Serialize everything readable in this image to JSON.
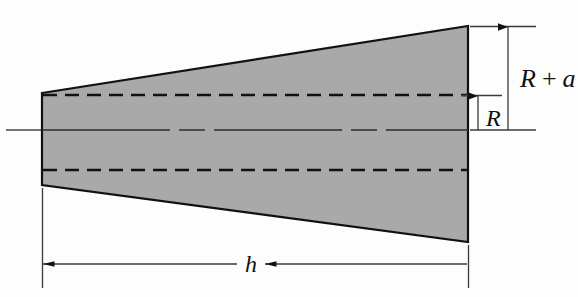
{
  "figure": {
    "type": "engineering-cross-section-diagram",
    "background_color": "#fdfdfd",
    "shape": {
      "name": "frustum-cross-section",
      "fill_color": "#a9a9a9",
      "stroke_color": "#111111",
      "stroke_width": 2,
      "vertices": [
        [
          42,
          93
        ],
        [
          468,
          26
        ],
        [
          468,
          242
        ],
        [
          42,
          185
        ]
      ]
    },
    "centerline": {
      "name": "axis-of-revolution",
      "color": "#2c2c2c",
      "y": 130,
      "x_start": 6,
      "x_end": 468,
      "style": "dash-dot"
    },
    "hidden_lines": [
      {
        "name": "upper-radius-line",
        "y": 95,
        "x_start": 44,
        "x_end": 468,
        "style": "dashed",
        "color": "#111111"
      },
      {
        "name": "lower-radius-line",
        "y": 170,
        "x_start": 44,
        "x_end": 468,
        "style": "dashed",
        "color": "#111111"
      }
    ],
    "dimensions": [
      {
        "id": "R-plus-a",
        "label": "R + a",
        "label_parts": {
          "symbol1": "R",
          "operator": "+",
          "symbol2": "a"
        },
        "orientation": "vertical",
        "from_y": 26,
        "to_y": 130,
        "line_x": 508,
        "arrow": "single-down-from-top",
        "extension_lines": [
          {
            "y": 26,
            "x_start": 470,
            "x_end": 534
          },
          {
            "y": 130,
            "x_start": 470,
            "x_end": 534
          }
        ]
      },
      {
        "id": "R",
        "label": "R",
        "orientation": "vertical",
        "from_y": 95,
        "to_y": 130,
        "line_x": 478,
        "arrow": "single-up-from-bottom",
        "extension_lines": [
          {
            "y": 95,
            "x_start": 462,
            "x_end": 500
          }
        ]
      },
      {
        "id": "h",
        "label": "h",
        "orientation": "horizontal",
        "from_x": 42,
        "to_x": 468,
        "line_y": 264,
        "arrow": "double",
        "extension_lines": [
          {
            "x": 42,
            "y_start": 188,
            "y_end": 285
          },
          {
            "x": 468,
            "y_start": 245,
            "y_end": 285
          }
        ]
      }
    ],
    "colors": {
      "shape_fill": "#a9a9a9",
      "outline": "#111111",
      "dimension_line": "#3a3a3a",
      "text": "#111111"
    }
  }
}
